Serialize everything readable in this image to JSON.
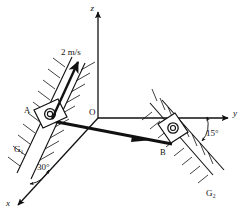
{
  "figure": {
    "type": "mechanics-diagram",
    "title": "",
    "caption": "",
    "background_color": "#ffffff",
    "line_color": "#111111"
  },
  "axes": {
    "z_label": "z",
    "y_label": "y",
    "x_label": "x",
    "origin_label": "O"
  },
  "points": {
    "a_label": "A",
    "b_label": "B"
  },
  "guides": {
    "g1_label": "G₁",
    "g2_label": "G₂"
  },
  "angles": {
    "angle_left": "30°",
    "angle_right": "15°"
  },
  "velocity": {
    "label": "2 m/s"
  }
}
